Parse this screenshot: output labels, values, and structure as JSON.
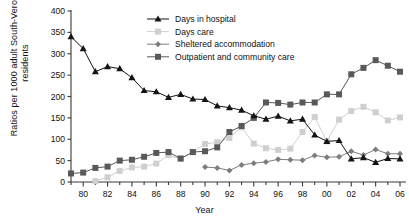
{
  "chart_data": {
    "type": "line",
    "title": "",
    "xlabel": "Year",
    "ylabel": "Ratios per 1000 adult South-Verona residents",
    "ylabel_line1": "Ratios per 1000 adult South-Verona",
    "ylabel_line2": "residents",
    "ylim": [
      0,
      400
    ],
    "yticks": [
      0,
      50,
      100,
      150,
      200,
      250,
      300,
      350,
      400
    ],
    "xlim": [
      1979,
      2006
    ],
    "xticks": [
      1980,
      1982,
      1984,
      1986,
      1988,
      1990,
      1992,
      1994,
      1996,
      1998,
      2000,
      2002,
      2004,
      2006
    ],
    "xticklabels": [
      "80",
      "82",
      "84",
      "86",
      "88",
      "90",
      "92",
      "94",
      "96",
      "98",
      "00",
      "02",
      "04",
      "06"
    ],
    "minor_xticks_every": 1,
    "grid": false,
    "legend_position": "top-center",
    "series": [
      {
        "name": "Days in hospital",
        "color": "#141414",
        "marker": "triangle",
        "x": [
          1979,
          1980,
          1981,
          1982,
          1983,
          1984,
          1985,
          1986,
          1987,
          1988,
          1989,
          1990,
          1991,
          1992,
          1993,
          1994,
          1995,
          1996,
          1997,
          1998,
          1999,
          2000,
          2001,
          2002,
          2003,
          2004,
          2005,
          2006
        ],
        "values": [
          340,
          312,
          258,
          270,
          265,
          244,
          214,
          211,
          198,
          205,
          194,
          193,
          178,
          174,
          168,
          155,
          147,
          154,
          143,
          147,
          110,
          95,
          97,
          54,
          57,
          46,
          55,
          54
        ]
      },
      {
        "name": "Days care",
        "color": "#cfcfcf",
        "marker": "square",
        "x": [
          1981,
          1982,
          1983,
          1984,
          1985,
          1986,
          1987,
          1988,
          1989,
          1990,
          1991,
          1992,
          1993,
          1994,
          1995,
          1996,
          1997,
          1998,
          1999,
          2000,
          2001,
          2002,
          2003,
          2004,
          2005,
          2006
        ],
        "values": [
          2,
          11,
          26,
          34,
          36,
          43,
          63,
          54,
          70,
          89,
          93,
          103,
          128,
          90,
          79,
          75,
          78,
          117,
          152,
          95,
          146,
          166,
          176,
          163,
          144,
          151
        ]
      },
      {
        "name": "Sheltered accommodation",
        "color": "#7d7d7d",
        "marker": "diamond",
        "x": [
          1990,
          1991,
          1992,
          1993,
          1994,
          1995,
          1996,
          1997,
          1998,
          1999,
          2000,
          2001,
          2002,
          2003,
          2004,
          2005,
          2006
        ],
        "values": [
          35,
          33,
          27,
          40,
          44,
          47,
          53,
          52,
          51,
          62,
          58,
          59,
          72,
          63,
          76,
          66,
          66
        ]
      },
      {
        "name": "Outpatient and community care",
        "color": "#595959",
        "marker": "square",
        "x": [
          1979,
          1980,
          1981,
          1982,
          1983,
          1984,
          1985,
          1986,
          1987,
          1988,
          1989,
          1990,
          1991,
          1992,
          1993,
          1994,
          1995,
          1996,
          1997,
          1998,
          1999,
          2000,
          2001,
          2002,
          2003,
          2004,
          2005,
          2006
        ],
        "values": [
          20,
          22,
          33,
          36,
          50,
          52,
          59,
          68,
          70,
          55,
          70,
          72,
          81,
          117,
          131,
          150,
          186,
          185,
          181,
          186,
          186,
          205,
          205,
          252,
          267,
          285,
          272,
          258
        ]
      }
    ]
  },
  "legend": {
    "items": [
      {
        "label": "Days in hospital"
      },
      {
        "label": "Days care"
      },
      {
        "label": "Sheltered accommodation"
      },
      {
        "label": "Outpatient and community care"
      }
    ]
  }
}
